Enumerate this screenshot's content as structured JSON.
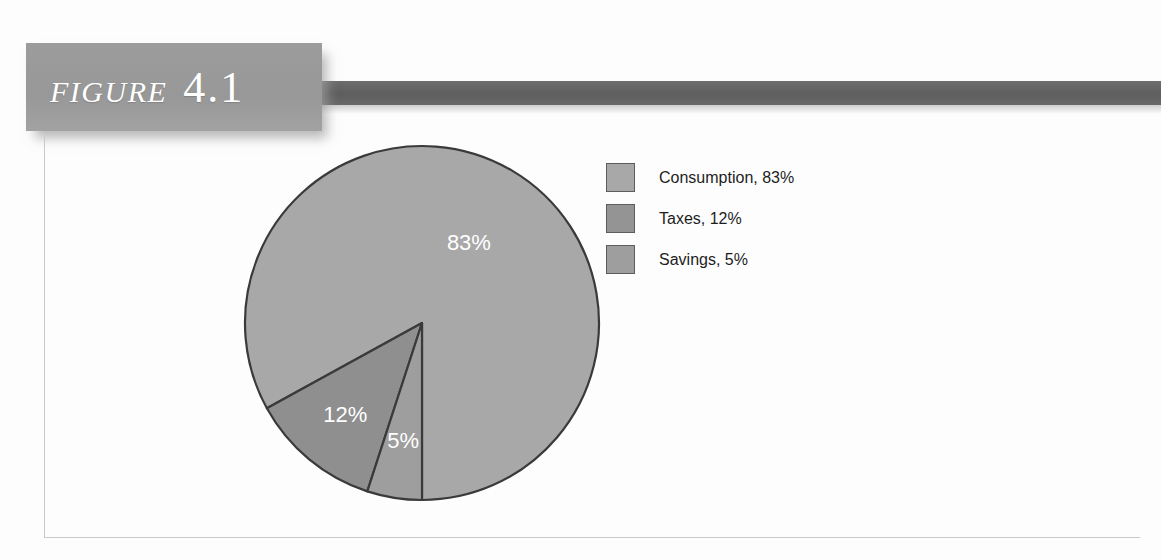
{
  "figure": {
    "word": "FIGURE",
    "number": "4.1"
  },
  "colors": {
    "tag_background": "#9a9a9a",
    "rule_bar": "#636363",
    "frame_border": "#c9c9c9",
    "slice_outline": "#3a3a3a",
    "consumption": "#a8a8a8",
    "taxes": "#8f8f8f",
    "savings": "#9e9e9e",
    "label_text": "#ffffff",
    "legend_text": "#1d1d1d"
  },
  "chart_data": {
    "type": "pie",
    "title": "",
    "subtitle": "",
    "xlabel": "",
    "ylabel": "",
    "grid": false,
    "legend_position": "right",
    "start_angle_deg": 180,
    "direction": "counterclockwise",
    "categories": [
      "Consumption",
      "Taxes",
      "Savings"
    ],
    "values": [
      83,
      12,
      5
    ],
    "unit": "%",
    "slices": [
      {
        "name": "Consumption",
        "value": 83,
        "data_label": "83%",
        "legend_label": "Consumption, 83%",
        "color": "#a8a8a8",
        "label_x": 470,
        "label_y": 250
      },
      {
        "name": "Taxes",
        "value": 12,
        "data_label": "12%",
        "legend_label": "Taxes, 12%",
        "color": "#8f8f8f",
        "label_x": 357,
        "label_y": 400
      },
      {
        "name": "Savings",
        "value": 5,
        "data_label": "5%",
        "legend_label": "Savings, 5%",
        "color": "#9e9e9e",
        "label_x": 394,
        "label_y": 464
      }
    ]
  },
  "legend": {
    "items": [
      {
        "label": "Consumption, 83%",
        "color": "#a8a8a8"
      },
      {
        "label": "Taxes, 12%",
        "color": "#949494"
      },
      {
        "label": "Savings, 5%",
        "color": "#9e9e9e"
      }
    ]
  }
}
